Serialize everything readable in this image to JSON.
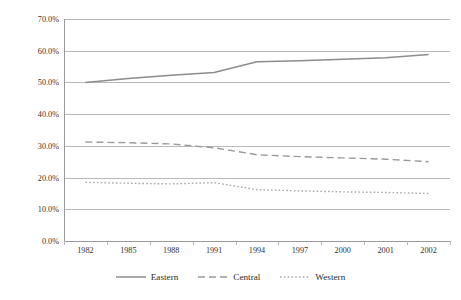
{
  "chart_data": {
    "type": "line",
    "title": "",
    "xlabel": "",
    "ylabel": "",
    "categories": [
      "1982",
      "1985",
      "1988",
      "1991",
      "1994",
      "1997",
      "2000",
      "2001",
      "2002"
    ],
    "ylim": [
      0,
      70
    ],
    "ytick_values": [
      0,
      10,
      20,
      30,
      40,
      50,
      60,
      70
    ],
    "ytick_labels": [
      "0.0%",
      "10.0%",
      "20.0%",
      "30.0%",
      "40.0%",
      "50.0%",
      "60.0%",
      "70.0%"
    ],
    "grid": "horizontal",
    "legend_position": "bottom-center",
    "series": [
      {
        "name": "Eastern",
        "style": "solid",
        "color": "#8c8c8c",
        "values": [
          50.0,
          51.2,
          52.3,
          53.1,
          56.5,
          56.8,
          57.3,
          57.8,
          58.8
        ]
      },
      {
        "name": "Central",
        "style": "dashed",
        "color": "#9a9a9a",
        "values": [
          31.2,
          31.0,
          30.6,
          29.4,
          27.2,
          26.6,
          26.2,
          25.8,
          25.0
        ]
      },
      {
        "name": "Western",
        "style": "dotted",
        "color": "#a8a8a8",
        "values": [
          18.5,
          18.2,
          18.0,
          18.4,
          16.2,
          15.8,
          15.5,
          15.3,
          15.0
        ]
      }
    ]
  },
  "legend": {
    "items": [
      {
        "label": "Eastern",
        "style": "solid"
      },
      {
        "label": "Central",
        "style": "dashed"
      },
      {
        "label": "Western",
        "style": "dotted"
      }
    ]
  },
  "colors": {
    "eastern": "#8c8c8c",
    "central": "#9a9a9a",
    "western": "#a8a8a8",
    "grid": "#b9b9b9",
    "axis": "#9a9a9a",
    "text": "#2b2b2b",
    "background": "#ffffff"
  }
}
